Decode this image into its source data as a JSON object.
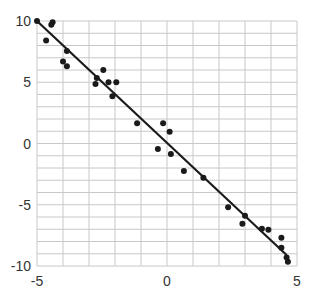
{
  "chart_data": {
    "type": "scatter",
    "title": "",
    "xlabel": "",
    "ylabel": "",
    "xlim": [
      -5,
      5
    ],
    "ylim": [
      -10,
      10
    ],
    "grid": true,
    "grid_step_x": 1,
    "grid_step_y": 1,
    "x_ticks": [
      -5,
      0,
      5
    ],
    "y_ticks": [
      10,
      5,
      0,
      -5,
      -10
    ],
    "x_tick_labels": [
      "-5",
      "0",
      "5"
    ],
    "y_tick_labels": [
      "10",
      "5",
      "0",
      "-5",
      "-10"
    ],
    "legend": [],
    "series": [
      {
        "name": "data",
        "points": [
          [
            -5.0,
            10.0
          ],
          [
            -4.4,
            9.9
          ],
          [
            -4.45,
            9.7
          ],
          [
            -4.65,
            8.4
          ],
          [
            -3.85,
            7.55
          ],
          [
            -4.0,
            6.7
          ],
          [
            -3.85,
            6.3
          ],
          [
            -2.7,
            5.35
          ],
          [
            -2.75,
            4.85
          ],
          [
            -2.45,
            6.0
          ],
          [
            -2.25,
            5.0
          ],
          [
            -1.95,
            5.0
          ],
          [
            -2.1,
            3.85
          ],
          [
            -1.15,
            1.65
          ],
          [
            -0.15,
            1.65
          ],
          [
            0.1,
            0.95
          ],
          [
            -0.35,
            -0.45
          ],
          [
            0.15,
            -0.85
          ],
          [
            0.65,
            -2.25
          ],
          [
            1.4,
            -2.8
          ],
          [
            2.35,
            -5.2
          ],
          [
            3.0,
            -5.9
          ],
          [
            2.9,
            -6.55
          ],
          [
            3.65,
            -6.95
          ],
          [
            3.9,
            -7.05
          ],
          [
            4.4,
            -7.7
          ],
          [
            4.4,
            -8.5
          ],
          [
            4.6,
            -9.3
          ],
          [
            4.65,
            -9.65
          ]
        ]
      }
    ],
    "fit_line": {
      "x": [
        -5.0,
        4.6
      ],
      "y": [
        10.0,
        -9.1
      ]
    }
  },
  "colors": {
    "point": "#1a1a1a",
    "line": "#1a1a1a",
    "grid": "#c8c8c8",
    "axis_text": "#333333"
  }
}
